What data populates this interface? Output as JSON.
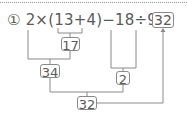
{
  "problem": {
    "number_label": "①",
    "expression": "2×(13+4)−18÷9=",
    "answer": "32"
  },
  "steps": [
    {
      "id": "step-17",
      "label": "17",
      "note": "13+4"
    },
    {
      "id": "step-34",
      "label": "34",
      "note": "2×17"
    },
    {
      "id": "step-2",
      "label": "2",
      "note": "18÷9"
    },
    {
      "id": "step-32",
      "label": "32",
      "note": "34−2"
    }
  ],
  "colors": {
    "text": "#5a5a5a",
    "line": "#8a8a8a",
    "dotted_rule": "#9a9a9a"
  }
}
